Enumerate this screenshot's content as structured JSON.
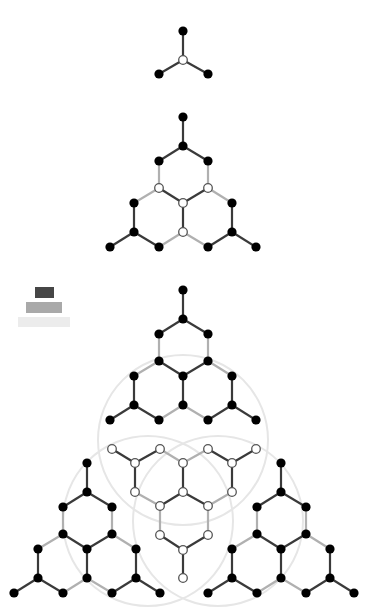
{
  "colors": {
    "edge_dark": "#3a3a3a",
    "edge_light": "#b0b0b0",
    "node_black": "#000000",
    "node_white_fill": "#ffffff",
    "node_white_stroke": "#555555",
    "circle": "#e6e6e6"
  },
  "legend": {
    "bars": [
      {
        "x": 35,
        "y": 287,
        "w": 19,
        "h": 11,
        "color": "#464646"
      },
      {
        "x": 26,
        "y": 302,
        "w": 36,
        "h": 11,
        "color": "#a9a9a9"
      },
      {
        "x": 18,
        "y": 317,
        "w": 52,
        "h": 10,
        "color": "#ececec"
      }
    ]
  },
  "circles": [
    {
      "cx": 183,
      "cy": 440,
      "r": 85
    },
    {
      "cx": 148,
      "cy": 521,
      "r": 85
    },
    {
      "cx": 218,
      "cy": 521,
      "r": 85
    }
  ],
  "structures": [
    {
      "name": "structure-1-star",
      "nodes": [
        {
          "id": "a",
          "x": 183,
          "y": 31,
          "t": "b"
        },
        {
          "id": "c",
          "x": 183,
          "y": 60,
          "t": "w"
        },
        {
          "id": "l",
          "x": 159,
          "y": 74,
          "t": "b"
        },
        {
          "id": "r",
          "x": 208,
          "y": 74,
          "t": "b"
        }
      ],
      "edges": [
        [
          "a",
          "c",
          "d"
        ],
        [
          "c",
          "l",
          "d"
        ],
        [
          "c",
          "r",
          "d"
        ]
      ]
    },
    {
      "name": "structure-2-triangle",
      "offset": [
        0,
        0
      ],
      "template": "tri",
      "ox": 0,
      "oy": 0,
      "white": [
        "n4",
        "n5",
        "n6",
        "n9"
      ]
    },
    {
      "name": "structure-3-top",
      "template": "tri",
      "ox": 0,
      "oy": 173,
      "white": []
    },
    {
      "name": "structure-3-left",
      "template": "tri",
      "ox": -96,
      "oy": 346,
      "white": []
    },
    {
      "name": "structure-3-right",
      "template": "tri",
      "ox": 98,
      "oy": 346,
      "white": []
    },
    {
      "name": "structure-3-middle-inverted",
      "template": "inv",
      "ox": 0,
      "oy": 0,
      "white": "all"
    }
  ],
  "templates": {
    "tri": {
      "nodes": [
        {
          "id": "n0",
          "x": 183,
          "y": 117
        },
        {
          "id": "n1",
          "x": 183,
          "y": 146
        },
        {
          "id": "n2",
          "x": 159,
          "y": 161
        },
        {
          "id": "n3",
          "x": 208,
          "y": 161
        },
        {
          "id": "n4",
          "x": 159,
          "y": 188
        },
        {
          "id": "n5",
          "x": 208,
          "y": 188
        },
        {
          "id": "n6",
          "x": 183,
          "y": 203
        },
        {
          "id": "n7",
          "x": 134,
          "y": 203
        },
        {
          "id": "n8",
          "x": 232,
          "y": 203
        },
        {
          "id": "n9",
          "x": 183,
          "y": 232
        },
        {
          "id": "n10",
          "x": 134,
          "y": 232
        },
        {
          "id": "n11",
          "x": 232,
          "y": 232
        },
        {
          "id": "n12",
          "x": 110,
          "y": 247
        },
        {
          "id": "n13",
          "x": 159,
          "y": 247
        },
        {
          "id": "n14",
          "x": 208,
          "y": 247
        },
        {
          "id": "n15",
          "x": 256,
          "y": 247
        }
      ],
      "edges": [
        [
          "n0",
          "n1",
          "d"
        ],
        [
          "n1",
          "n2",
          "d"
        ],
        [
          "n1",
          "n3",
          "d"
        ],
        [
          "n2",
          "n4",
          "l"
        ],
        [
          "n3",
          "n5",
          "l"
        ],
        [
          "n4",
          "n6",
          "d"
        ],
        [
          "n5",
          "n6",
          "d"
        ],
        [
          "n4",
          "n7",
          "l"
        ],
        [
          "n5",
          "n8",
          "l"
        ],
        [
          "n6",
          "n9",
          "d"
        ],
        [
          "n7",
          "n10",
          "d"
        ],
        [
          "n8",
          "n11",
          "d"
        ],
        [
          "n10",
          "n12",
          "d"
        ],
        [
          "n10",
          "n13",
          "d"
        ],
        [
          "n13",
          "n9",
          "l"
        ],
        [
          "n9",
          "n14",
          "l"
        ],
        [
          "n14",
          "n11",
          "d"
        ],
        [
          "n11",
          "n15",
          "d"
        ]
      ]
    },
    "inv": {
      "nodes": [
        {
          "id": "m0",
          "x": 112,
          "y": 449
        },
        {
          "id": "m1",
          "x": 160,
          "y": 449
        },
        {
          "id": "m2",
          "x": 208,
          "y": 449
        },
        {
          "id": "m3",
          "x": 256,
          "y": 449
        },
        {
          "id": "m4",
          "x": 135,
          "y": 463
        },
        {
          "id": "m5",
          "x": 183,
          "y": 463
        },
        {
          "id": "m6",
          "x": 232,
          "y": 463
        },
        {
          "id": "m7",
          "x": 135,
          "y": 492
        },
        {
          "id": "m8",
          "x": 183,
          "y": 492
        },
        {
          "id": "m9",
          "x": 232,
          "y": 492
        },
        {
          "id": "m10",
          "x": 160,
          "y": 506
        },
        {
          "id": "m11",
          "x": 208,
          "y": 506
        },
        {
          "id": "m12",
          "x": 160,
          "y": 535
        },
        {
          "id": "m13",
          "x": 208,
          "y": 535
        },
        {
          "id": "m14",
          "x": 183,
          "y": 550
        },
        {
          "id": "m15",
          "x": 183,
          "y": 578
        }
      ],
      "edges": [
        [
          "m0",
          "m4",
          "d"
        ],
        [
          "m1",
          "m4",
          "d"
        ],
        [
          "m1",
          "m5",
          "l"
        ],
        [
          "m5",
          "m2",
          "l"
        ],
        [
          "m2",
          "m6",
          "d"
        ],
        [
          "m3",
          "m6",
          "d"
        ],
        [
          "m4",
          "m7",
          "d"
        ],
        [
          "m5",
          "m8",
          "d"
        ],
        [
          "m6",
          "m9",
          "d"
        ],
        [
          "m7",
          "m10",
          "l"
        ],
        [
          "m10",
          "m8",
          "d"
        ],
        [
          "m8",
          "m11",
          "d"
        ],
        [
          "m11",
          "m9",
          "l"
        ],
        [
          "m10",
          "m12",
          "l"
        ],
        [
          "m11",
          "m13",
          "l"
        ],
        [
          "m12",
          "m14",
          "d"
        ],
        [
          "m13",
          "m14",
          "d"
        ],
        [
          "m14",
          "m15",
          "d"
        ]
      ]
    }
  }
}
